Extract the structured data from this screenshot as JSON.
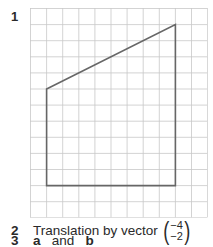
{
  "question1": {
    "number": "1",
    "grid": {
      "cols": 11,
      "rows": 13,
      "cell_px": 16.1,
      "line_color": "#c8c8c8",
      "shape_color": "#666666"
    },
    "shape": {
      "name": "trapezoid",
      "vertices": [
        [
          1,
          5
        ],
        [
          9,
          1
        ],
        [
          9,
          11
        ],
        [
          1,
          11
        ]
      ]
    }
  },
  "question2": {
    "number": "2",
    "text": "Translation by vector",
    "vector": {
      "top": "−4",
      "bottom": "−2"
    }
  },
  "question3": {
    "number": "3",
    "part_a": "a",
    "joiner": "and",
    "part_b": "b"
  }
}
